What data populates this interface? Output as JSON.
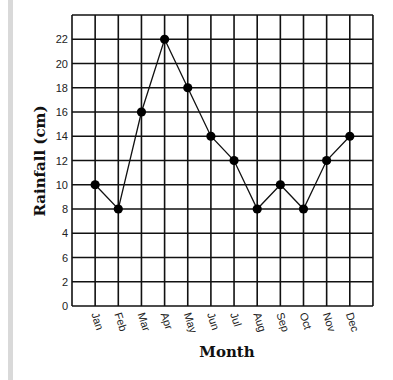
{
  "chart_data": {
    "type": "line",
    "title": "",
    "xlabel": "Month",
    "ylabel": "Rainfall (cm)",
    "categories": [
      "Jan",
      "Feb",
      "Mar",
      "Apr",
      "May",
      "Jun",
      "Jul",
      "Aug",
      "Sep",
      "Oct",
      "Nov",
      "Dec"
    ],
    "series": [
      {
        "name": "Rainfall",
        "values": [
          10,
          8,
          16,
          22,
          18,
          14,
          12,
          8,
          10,
          8,
          12,
          14
        ]
      }
    ],
    "ylim": [
      0,
      24
    ],
    "y_tick_labels_bottom_to_top": [
      "0",
      "2",
      "6",
      "4",
      "8",
      "10",
      "12",
      "14",
      "16",
      "18",
      "20",
      "22"
    ],
    "grid": true,
    "legend": "none",
    "marker": "filled-circle",
    "color": "#000000"
  }
}
